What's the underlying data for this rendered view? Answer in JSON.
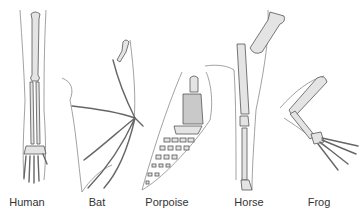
{
  "figure": {
    "specimens": [
      {
        "id": "human",
        "label": "Human",
        "x": 27
      },
      {
        "id": "bat",
        "label": "Bat",
        "x": 97
      },
      {
        "id": "porpoise",
        "label": "Porpoise",
        "x": 167
      },
      {
        "id": "horse",
        "label": "Horse",
        "x": 249
      },
      {
        "id": "frog",
        "label": "Frog",
        "x": 319
      }
    ]
  },
  "colors": {
    "background": "#ffffff",
    "bone_fill": "#e4e4e4",
    "bone_shade": "#c9c9c9",
    "outline": "#8a8a8a",
    "label_text": "#333333"
  }
}
